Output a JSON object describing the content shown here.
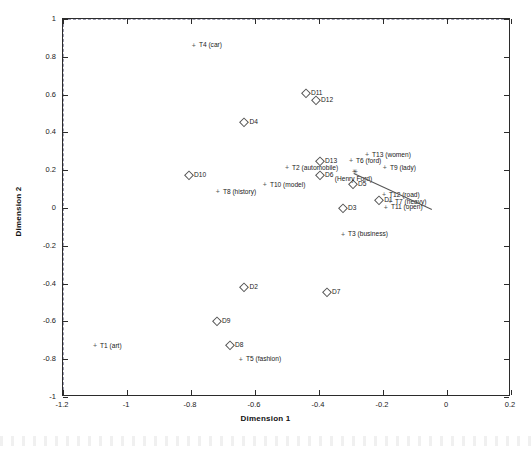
{
  "chart_data": {
    "type": "scatter",
    "title": "",
    "xlabel": "Dimension 1",
    "ylabel": "Dimension 2",
    "xlim": [
      -1.2,
      0.2
    ],
    "ylim": [
      -1.0,
      1.0
    ],
    "xticks": [
      "-1.2",
      "-1",
      "-0.8",
      "-0.6",
      "-0.4",
      "-0.2",
      "0",
      "0.2"
    ],
    "xtickvals": [
      -1.2,
      -1.0,
      -0.8,
      -0.6,
      -0.4,
      -0.2,
      0.0,
      0.2
    ],
    "yticks": [
      "1",
      "0.8",
      "0.6",
      "0.4",
      "0.2",
      "0",
      "-0.2",
      "-0.4",
      "-0.6",
      "-0.8",
      "-1"
    ],
    "ytickvals": [
      1.0,
      0.8,
      0.6,
      0.4,
      0.2,
      0.0,
      -0.2,
      -0.4,
      -0.6,
      -0.8,
      -1.0
    ],
    "grid": false,
    "legend": "none",
    "zero_reference_lines": {
      "horizontal": 0.0,
      "vertical": 0.0,
      "style": "dashed"
    },
    "series": [
      {
        "name": "Documents",
        "marker": "diamond-open",
        "points": [
          {
            "label": "D1",
            "x": -0.212,
            "y": 0.042
          },
          {
            "label": "D2",
            "x": -0.633,
            "y": -0.418
          },
          {
            "label": "D3",
            "x": -0.325,
            "y": -0.002
          },
          {
            "label": "D4",
            "x": -0.633,
            "y": 0.455
          },
          {
            "label": "D5",
            "x": -0.294,
            "y": 0.127
          },
          {
            "label": "D6",
            "x": -0.397,
            "y": 0.175
          },
          {
            "label": "D7",
            "x": -0.375,
            "y": -0.445
          },
          {
            "label": "D8",
            "x": -0.678,
            "y": -0.725
          },
          {
            "label": "D9",
            "x": -0.719,
            "y": -0.598
          },
          {
            "label": "D10",
            "x": -0.806,
            "y": 0.175
          },
          {
            "label": "D11",
            "x": -0.441,
            "y": 0.608
          },
          {
            "label": "D12",
            "x": -0.409,
            "y": 0.571
          },
          {
            "label": "D13",
            "x": -0.397,
            "y": 0.249
          }
        ]
      },
      {
        "name": "Terms",
        "marker": "plus",
        "points": [
          {
            "label": "T1 (art)",
            "x": -1.1,
            "y": -0.73
          },
          {
            "label": "T2 (automobile)",
            "x": -0.5,
            "y": 0.212
          },
          {
            "label": "T3 (business)",
            "x": -0.325,
            "y": -0.138
          },
          {
            "label": "T4 (car)",
            "x": -0.791,
            "y": 0.862
          },
          {
            "label": "T5 (fashion)",
            "x": -0.644,
            "y": -0.799
          },
          {
            "label": "T6 (ford)",
            "x": -0.3,
            "y": 0.249
          },
          {
            "label": "T7 (heavy)",
            "x": -0.178,
            "y": 0.032
          },
          {
            "label": "T8 (history)",
            "x": -0.716,
            "y": 0.085
          },
          {
            "label": "T9 (lady)",
            "x": -0.194,
            "y": 0.212
          },
          {
            "label": "T10 (model)",
            "x": -0.569,
            "y": 0.122
          },
          {
            "label": "T11 (open)",
            "x": -0.191,
            "y": 0.005
          },
          {
            "label": "T12 (road)",
            "x": -0.197,
            "y": 0.069
          },
          {
            "label": "T13 (women)",
            "x": -0.25,
            "y": 0.281
          }
        ]
      },
      {
        "name": "Query",
        "marker": "asterisk",
        "points": [
          {
            "label": "(Henry Ford)",
            "x": -0.288,
            "y": 0.191
          }
        ]
      }
    ],
    "annotation_lines": [
      {
        "from": [
          -0.291,
          0.186
        ],
        "to": [
          -0.047,
          -0.005
        ]
      }
    ]
  }
}
